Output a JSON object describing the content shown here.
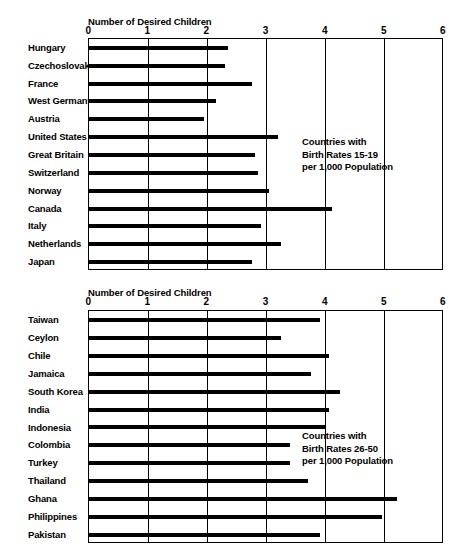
{
  "chart_data": [
    {
      "type": "bar",
      "orientation": "horizontal",
      "title": "",
      "xlabel": "Number of Desired Children",
      "ylabel": "",
      "xlim": [
        0,
        6
      ],
      "xticks": [
        0,
        1,
        2,
        3,
        4,
        5,
        6
      ],
      "xtick_labels": [
        "0",
        "1",
        "2",
        "3",
        "4",
        "5",
        "6"
      ],
      "grid": true,
      "legend": false,
      "annotation": [
        "Countries with",
        "Birth Rates 15-19",
        "per 1,000 Population"
      ],
      "categories": [
        "Hungary",
        "Czechoslovakia",
        "France",
        "West Germany",
        "Austria",
        "United States",
        "Great Britain",
        "Switzerland",
        "Norway",
        "Canada",
        "Italy",
        "Netherlands",
        "Japan"
      ],
      "values": [
        2.35,
        2.3,
        2.75,
        2.15,
        1.95,
        3.2,
        2.8,
        2.85,
        3.05,
        4.1,
        2.9,
        3.25,
        2.75
      ]
    },
    {
      "type": "bar",
      "orientation": "horizontal",
      "title": "",
      "xlabel": "Number of Desired Children",
      "ylabel": "",
      "xlim": [
        0,
        6
      ],
      "xticks": [
        0,
        1,
        2,
        3,
        4,
        5,
        6
      ],
      "xtick_labels": [
        "0",
        "1",
        "2",
        "3",
        "4",
        "5",
        "6"
      ],
      "grid": true,
      "legend": false,
      "annotation": [
        "Countries with",
        "Birth Rates 26-50",
        "per 1,000 Population"
      ],
      "categories": [
        "Taiwan",
        "Ceylon",
        "Chile",
        "Jamaica",
        "South Korea",
        "India",
        "Indonesia",
        "Colombia",
        "Turkey",
        "Thailand",
        "Ghana",
        "Philippines",
        "Pakistan"
      ],
      "values": [
        3.9,
        3.25,
        4.05,
        3.75,
        4.25,
        4.05,
        4.0,
        3.4,
        3.4,
        3.7,
        5.2,
        4.95,
        3.9
      ]
    }
  ],
  "panels": {
    "top": {
      "axis_caption": "Number of Desired Children",
      "tick_labels": [
        "0",
        "1",
        "2",
        "3",
        "4",
        "5",
        "6"
      ],
      "annotation_line1": "Countries with",
      "annotation_line2": "Birth Rates 15-19",
      "annotation_line3": "per 1,000 Population",
      "categories": [
        "Hungary",
        "Czechoslovakia",
        "France",
        "West Germany",
        "Austria",
        "United States",
        "Great Britain",
        "Switzerland",
        "Norway",
        "Canada",
        "Italy",
        "Netherlands",
        "Japan"
      ]
    },
    "bottom": {
      "axis_caption": "Number of Desired Children",
      "tick_labels": [
        "0",
        "1",
        "2",
        "3",
        "4",
        "5",
        "6"
      ],
      "annotation_line1": "Countries with",
      "annotation_line2": "Birth Rates 26-50",
      "annotation_line3": "per 1,000 Population",
      "categories": [
        "Taiwan",
        "Ceylon",
        "Chile",
        "Jamaica",
        "South Korea",
        "India",
        "Indonesia",
        "Colombia",
        "Turkey",
        "Thailand",
        "Ghana",
        "Philippines",
        "Pakistan"
      ]
    }
  },
  "colors": {
    "bar": "#000000",
    "axis": "#000000",
    "background": "#ffffff"
  }
}
